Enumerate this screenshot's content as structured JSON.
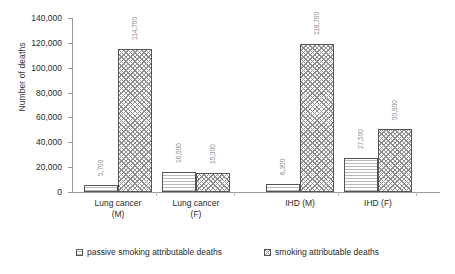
{
  "chart_data": {
    "type": "bar",
    "title": "",
    "xlabel": "",
    "ylabel": "Number of deaths",
    "ylim": [
      0,
      140000
    ],
    "ytick_step": 20000,
    "grid": false,
    "legend_position": "bottom",
    "categories": [
      "Lung cancer\n(M)",
      "Lung cancer\n(F)",
      "IHD (M)",
      "IHD (F)"
    ],
    "ytick_labels": [
      "0",
      "20,000",
      "40,000",
      "60,000",
      "80,000",
      "100,000",
      "120,000",
      "140,000"
    ],
    "ytick_values": [
      0,
      20000,
      40000,
      60000,
      80000,
      100000,
      120000,
      140000
    ],
    "series": [
      {
        "name": "passive smoking attributable deaths",
        "pattern": "horizontal-lines",
        "values": [
          5700,
          16500,
          6300,
          27500
        ],
        "labels": [
          "5,700",
          "16,500",
          "6,300",
          "27,500"
        ]
      },
      {
        "name": "smoking attributable deaths",
        "pattern": "cross-hatch",
        "values": [
          114700,
          15300,
          118700,
          50900
        ],
        "labels": [
          "114,700",
          "15,300",
          "118,700",
          "50,900"
        ]
      }
    ]
  },
  "legend": {
    "items": [
      {
        "label": "passive smoking attributable deaths",
        "pattern": "passive"
      },
      {
        "label": "smoking attributable deaths",
        "pattern": "smoking"
      }
    ]
  }
}
